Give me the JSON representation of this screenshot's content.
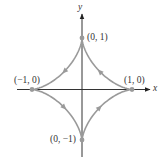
{
  "diagram": {
    "type": "parametric-curve",
    "axes": {
      "x_label": "x",
      "y_label": "y"
    },
    "points": [
      {
        "id": "top",
        "label": "(0, 1)",
        "x": 0,
        "y": 1
      },
      {
        "id": "left",
        "label": "(−1, 0)",
        "x": -1,
        "y": 0
      },
      {
        "id": "right",
        "label": "(1, 0)",
        "x": 1,
        "y": 0
      },
      {
        "id": "bottom",
        "label": "(0, −1)",
        "x": 0,
        "y": -1
      }
    ],
    "direction": "counterclockwise",
    "colors": {
      "curve": "#9a9a9a",
      "axes": "#333333",
      "points": "#9a9a9a",
      "text": "#333333"
    }
  }
}
